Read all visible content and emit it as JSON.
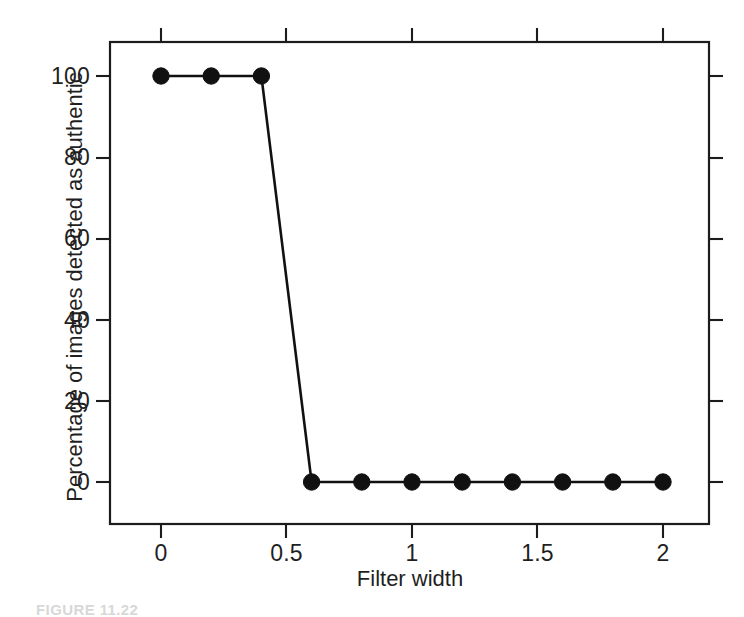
{
  "chart_data": {
    "type": "line",
    "title": "",
    "subtitle": "",
    "xlabel": "Filter width",
    "ylabel": "Percentage of images detected as authentic",
    "x": [
      0,
      0.2,
      0.4,
      0.6,
      0.8,
      1.0,
      1.2,
      1.4,
      1.6,
      1.8,
      2.0
    ],
    "values": [
      100,
      100,
      100,
      0,
      0,
      0,
      0,
      0,
      0,
      0,
      0
    ],
    "series": [
      {
        "name": "Percentage of images detected as authentic",
        "x": [
          0,
          0.2,
          0.4,
          0.6,
          0.8,
          1.0,
          1.2,
          1.4,
          1.6,
          1.8,
          2.0
        ],
        "values": [
          100,
          100,
          100,
          0,
          0,
          0,
          0,
          0,
          0,
          0,
          0
        ],
        "marker": "filled-circle",
        "color": "#111111"
      }
    ],
    "xlim": [
      -0.1,
      2.1
    ],
    "ylim": [
      -5,
      108
    ],
    "xticks": [
      0,
      0.5,
      1,
      1.5,
      2
    ],
    "xticklabels": [
      "0",
      "0.5",
      "1",
      "1.5",
      "2"
    ],
    "yticks": [
      0,
      20,
      40,
      60,
      80,
      100
    ],
    "yticklabels": [
      "0",
      "20",
      "40",
      "60",
      "80",
      "100"
    ],
    "grid": false,
    "legend": false,
    "legend_position": "none",
    "frame": "box",
    "tick_direction": "out",
    "annotations": []
  },
  "axes": {
    "x_title": "Filter width",
    "y_title": "Percentage of images detected as authentic",
    "x_tick_labels": [
      "0",
      "0.5",
      "1",
      "1.5",
      "2"
    ],
    "y_tick_labels": [
      "0",
      "20",
      "40",
      "60",
      "80",
      "100"
    ]
  },
  "caption": {
    "text": "FIGURE 11.22"
  },
  "colors": {
    "line": "#111111",
    "marker": "#111111",
    "frame": "#1c1c1c",
    "text": "#1f1f1f",
    "background": "#ffffff"
  }
}
